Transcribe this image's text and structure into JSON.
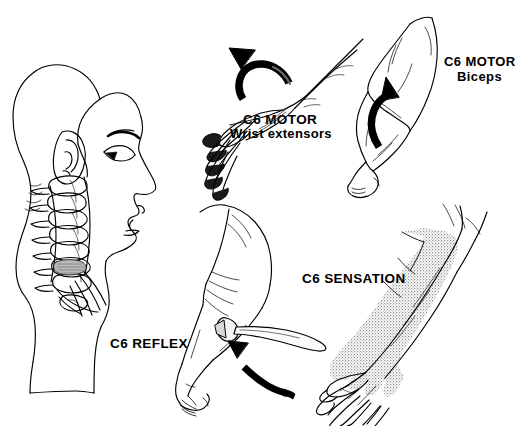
{
  "figure": {
    "background_color": "#ffffff",
    "ink_color": "#000000",
    "stipple_color": "#8a8a8a"
  },
  "labels": {
    "motor_wrist": {
      "line1": "C6 MOTOR",
      "line2": "Wrist extensors"
    },
    "motor_biceps": {
      "line1": "C6 MOTOR",
      "line2": "Biceps"
    },
    "sensation": {
      "line1": "C6 SENSATION"
    },
    "reflex": {
      "line1": "C6 REFLEX"
    }
  },
  "panels": [
    {
      "name": "head-neck-cervical-spine",
      "description": "Lateral profile of head and neck with cervical vertebrae"
    },
    {
      "name": "wrist-extension",
      "description": "Dorsum of hand with curved arrow indicating wrist extension"
    },
    {
      "name": "elbow-flexion-biceps",
      "description": "Flexed arm with upward curved arrow indicating biceps contraction"
    },
    {
      "name": "brachioradialis-reflex",
      "description": "Reflex hammer striking forearm with arrow showing reflex response"
    },
    {
      "name": "c6-dermatome",
      "description": "Outstretched arm with stippled C6 dermatome over radial forearm and thumb"
    }
  ]
}
